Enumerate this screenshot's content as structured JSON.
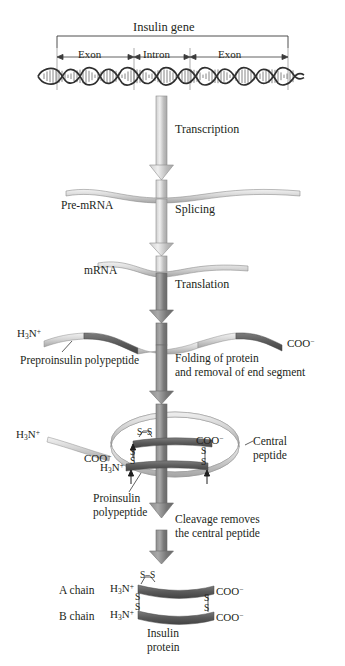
{
  "figure": {
    "gene_label": "Insulin gene",
    "segments": [
      {
        "name": "Exon",
        "label": "Exon"
      },
      {
        "name": "Intron",
        "label": "Intron"
      },
      {
        "name": "Exon2",
        "label": "Exon"
      }
    ],
    "steps": [
      {
        "id": "transcription",
        "label": "Transcription"
      },
      {
        "id": "splicing",
        "label": "Splicing"
      },
      {
        "id": "translation",
        "label": "Translation"
      },
      {
        "id": "folding",
        "label": "Folding of protein",
        "label2": "and removal of end segment"
      },
      {
        "id": "cleavage",
        "label": "Cleavage removes",
        "label2": "the central peptide"
      }
    ],
    "molecules": {
      "pre_mrna": "Pre-mRNA",
      "mrna": "mRNA",
      "preproinsulin": "Preproinsulin polypeptide",
      "proinsulin": "Proinsulin",
      "proinsulin2": "polypeptide",
      "central_peptide": "Central",
      "central_peptide2": "peptide",
      "a_chain": "A chain",
      "b_chain": "B chain",
      "insulin": "Insulin",
      "insulin2": "protein"
    },
    "termini": {
      "amino": "H<sub>3</sub>N<sup>+</sup>",
      "carboxyl": "COO<sup>−</sup>"
    },
    "bonds": {
      "disulfide_horizontal": "S–S",
      "sulfur": "S"
    },
    "colors": {
      "ink": "#231f20",
      "arrow_light": "#b9b9b9",
      "arrow_dark": "#7a7a7a",
      "ribbon_light": "#d8d8d8",
      "chain_dark": "#595959",
      "helix_dark": "#4a4a4a",
      "rule": "#6b6b6b"
    }
  }
}
